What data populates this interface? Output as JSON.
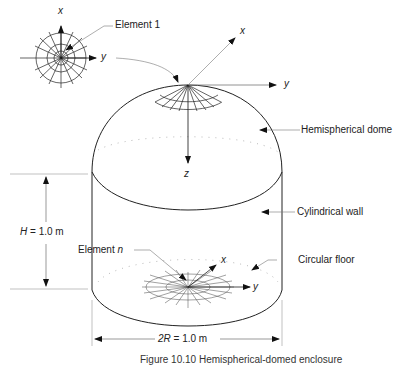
{
  "diagram": {
    "labels": {
      "element_1": "Element 1",
      "element_n_prefix": "Element ",
      "element_n_var": "n",
      "hemispherical_dome": "Hemispherical dome",
      "cylindrical_wall": "Cylindrical wall",
      "circular_floor": "Circular floor"
    },
    "dimensions": {
      "height_var": "H",
      "height_value": " = 1.0 m",
      "diameter_var": "2R",
      "diameter_value": " = 1.0 m"
    },
    "axes": {
      "inset": {
        "x": "x",
        "y": "y"
      },
      "dome": {
        "x": "x",
        "y": "y",
        "z": "z"
      },
      "floor": {
        "x": "x",
        "y": "y"
      }
    },
    "caption": "Figure 10.10  Hemispherical-domed enclosure"
  }
}
